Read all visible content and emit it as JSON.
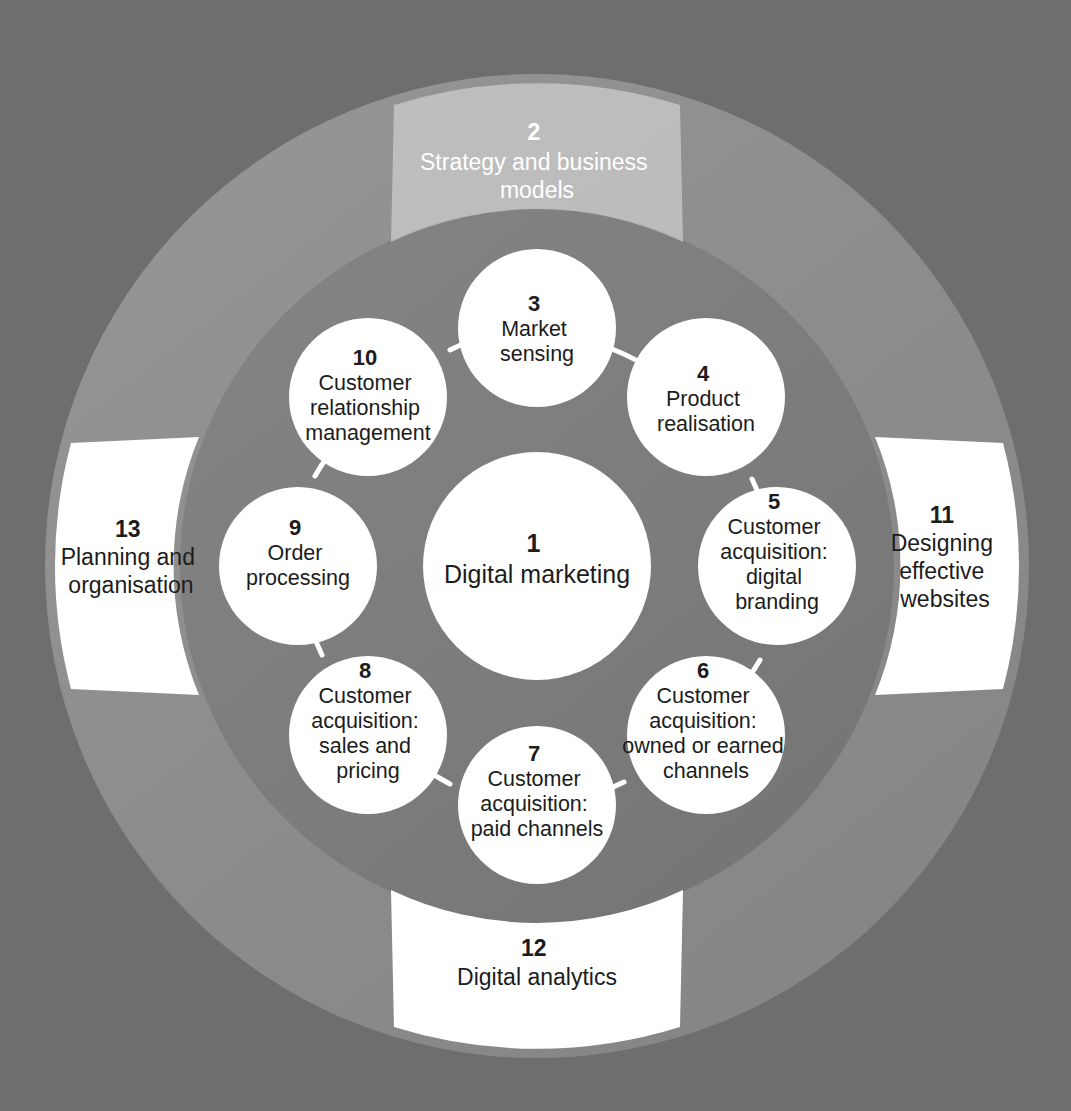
{
  "figure": {
    "type": "concentric-circular-diagram",
    "background_color": "#6e6e6e",
    "outer_ring_color": "#8c8c8c",
    "inner_disc_color": "#7b7b7b",
    "node_fill": "#ffffff",
    "node_text_color": "#1c1c1c",
    "muted_segment_fill": "#b6b6b6",
    "muted_segment_text_color": "#ffffff"
  },
  "centre": {
    "number": "1",
    "label": "Digital marketing"
  },
  "inner_circles": [
    {
      "number": "3",
      "lines": [
        "Market",
        "sensing"
      ]
    },
    {
      "number": "4",
      "lines": [
        "Product",
        "realisation"
      ]
    },
    {
      "number": "5",
      "lines": [
        "Customer",
        "acquisition:",
        "digital",
        "branding"
      ]
    },
    {
      "number": "6",
      "lines": [
        "Customer",
        "acquisition:",
        "owned or earned",
        "channels"
      ]
    },
    {
      "number": "7",
      "lines": [
        "Customer",
        "acquisition:",
        "paid channels"
      ]
    },
    {
      "number": "8",
      "lines": [
        "Customer",
        "acquisition:",
        "sales and",
        "pricing"
      ]
    },
    {
      "number": "9",
      "lines": [
        "Order",
        "processing"
      ]
    },
    {
      "number": "10",
      "lines": [
        "Customer",
        "relationship",
        "management"
      ]
    }
  ],
  "outer_segments": [
    {
      "number": "2",
      "lines": [
        "Strategy and business",
        "models"
      ],
      "position": "top",
      "state": "muted"
    },
    {
      "number": "11",
      "lines": [
        "Designing",
        "effective",
        "websites"
      ],
      "position": "right",
      "state": "normal"
    },
    {
      "number": "12",
      "lines": [
        "Digital analytics"
      ],
      "position": "bottom",
      "state": "normal"
    },
    {
      "number": "13",
      "lines": [
        "Planning and",
        "organisation"
      ],
      "position": "left",
      "state": "normal"
    }
  ]
}
